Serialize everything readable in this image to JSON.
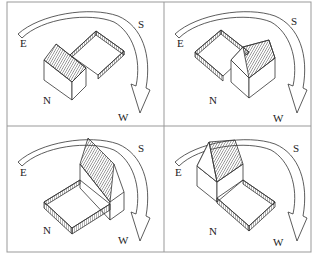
{
  "figure": {
    "panels": [
      {
        "id": "top-left",
        "labels": {
          "east": "E",
          "south": "S",
          "north": "N",
          "west": "W"
        },
        "house_position": "north-east, yard extends south-west"
      },
      {
        "id": "top-right",
        "labels": {
          "east": "E",
          "south": "S",
          "north": "N",
          "west": "W"
        },
        "house_position": "south-west, yard extends north-east"
      },
      {
        "id": "bottom-left",
        "labels": {
          "east": "E",
          "south": "S",
          "north": "N",
          "west": "W"
        },
        "house_position": "south, yard extends north"
      },
      {
        "id": "bottom-right",
        "labels": {
          "east": "E",
          "south": "S",
          "north": "N",
          "west": "W"
        },
        "house_position": "east, yard extends south-west"
      }
    ]
  },
  "colors": {
    "line": "#333333",
    "border": "#999999",
    "hatch": "#444444",
    "background": "#ffffff"
  }
}
